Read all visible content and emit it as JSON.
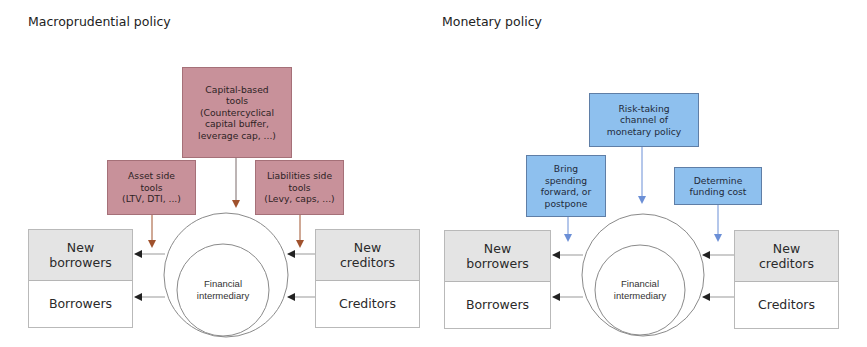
{
  "panels": {
    "macro": {
      "title": "Macroprudential policy",
      "top_tool": "Capital-based\ntools\n(Countercyclical\ncapital buffer,\nleverage cap, ...)",
      "left_tool": "Asset side\ntools\n(LTV, DTI, ...)",
      "right_tool": "Liabilities side\ntools\n(Levy, caps, ...)",
      "left_party": {
        "new": "New\nborrowers",
        "existing": "Borrowers"
      },
      "right_party": {
        "new": "New\ncreditors",
        "existing": "Creditors"
      },
      "center": "Financial\nintermediary",
      "box_color": "#c8919a",
      "arrow_color": "#a0522d"
    },
    "monetary": {
      "title": "Monetary policy",
      "top_tool": "Risk-taking\nchannel of\nmonetary policy",
      "left_tool": "Bring\nspending\nforward, or\npostpone",
      "right_tool": "Determine\nfunding cost",
      "left_party": {
        "new": "New\nborrowers",
        "existing": "Borrowers"
      },
      "right_party": {
        "new": "New\ncreditors",
        "existing": "Creditors"
      },
      "center": "Financial\nintermediary",
      "box_color": "#8ec0ee",
      "arrow_color": "#6b8fd6"
    }
  }
}
